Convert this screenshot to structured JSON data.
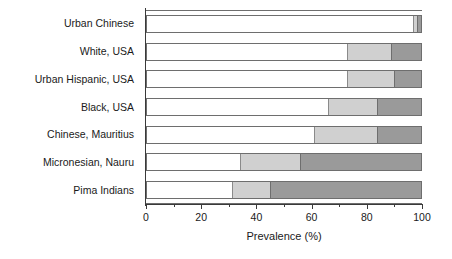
{
  "chart_data": {
    "type": "bar",
    "orientation": "horizontal",
    "stacked": true,
    "title": "",
    "xlabel": "Prevalence (%)",
    "ylabel": "",
    "xlim": [
      0,
      100
    ],
    "xticks": [
      0,
      20,
      40,
      60,
      80,
      100
    ],
    "xtick_labels": [
      "0",
      "20",
      "40",
      "60",
      "80",
      "100"
    ],
    "minor_xticks": [
      10,
      30,
      50,
      70,
      90
    ],
    "grid": false,
    "legend": "none",
    "categories": [
      "Urban Chinese",
      "White, USA",
      "Urban Hispanic, USA",
      "Black, USA",
      "Chinese, Mauritius",
      "Micronesian, Nauru",
      "Pima Indians"
    ],
    "series": [
      {
        "name": "Normal",
        "color": "#ffffff",
        "values": [
          97,
          73,
          73,
          66,
          61,
          34,
          31
        ]
      },
      {
        "name": "IGT",
        "color": "#d0d0d0",
        "values": [
          1.5,
          16,
          17,
          18,
          23,
          22,
          14
        ]
      },
      {
        "name": "Diabetes",
        "color": "#9a9a9a",
        "values": [
          1.5,
          11,
          10,
          16,
          16,
          44,
          55
        ]
      }
    ]
  }
}
